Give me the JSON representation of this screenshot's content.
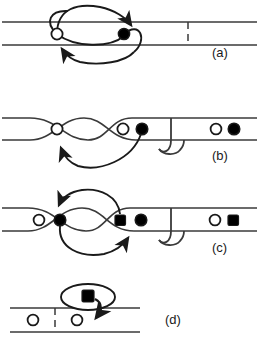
{
  "figure": {
    "type": "diagram",
    "background_color": "#ffffff",
    "stroke_color": "#1a1a1a",
    "fill_open": "#ffffff",
    "fill_solid": "#000000",
    "panels": [
      {
        "id": "a",
        "label": "(a)",
        "label_x": 212,
        "label_y": 57,
        "track": {
          "top_y": 22,
          "bottom_y": 45,
          "x_start": 2,
          "x_end": 257
        },
        "separator": {
          "x": 188,
          "style": "dashed"
        },
        "tokens": [
          {
            "shape": "circle",
            "fill": "open",
            "cx": 57,
            "cy": 34
          },
          {
            "shape": "circle",
            "fill": "solid",
            "cx": 124,
            "cy": 34
          }
        ],
        "arrows": [
          {
            "from": "open-circle",
            "to": "solid-circle",
            "direction": "right",
            "arrowhead_at": "upper-right"
          },
          {
            "from": "solid-circle",
            "to": "open-circle",
            "direction": "left",
            "arrowhead_at": "lower-left"
          }
        ]
      },
      {
        "id": "b",
        "label": "(b)",
        "label_x": 212,
        "label_y": 160,
        "track": {
          "top_y": 118,
          "bottom_y": 140,
          "x_start": 2,
          "x_end": 257
        },
        "gap": {
          "x": 168,
          "style": "j-hook"
        },
        "tokens": [
          {
            "shape": "circle",
            "fill": "open",
            "cx": 57,
            "cy": 129
          },
          {
            "shape": "circle",
            "fill": "open",
            "cx": 123,
            "cy": 129
          },
          {
            "shape": "circle",
            "fill": "solid",
            "cx": 141,
            "cy": 129
          },
          {
            "shape": "circle",
            "fill": "open",
            "cx": 216,
            "cy": 129
          },
          {
            "shape": "circle",
            "fill": "solid",
            "cx": 233,
            "cy": 129
          }
        ],
        "arrows": [
          {
            "from": "solid-circle",
            "to": "open-circle",
            "direction": "left",
            "arrowhead_at": "lower-left"
          }
        ]
      },
      {
        "id": "c",
        "label": "(c)",
        "label_x": 212,
        "label_y": 252,
        "track": {
          "top_y": 208,
          "bottom_y": 231,
          "x_start": 2,
          "x_end": 257
        },
        "gap": {
          "x": 168,
          "style": "j-hook"
        },
        "tokens": [
          {
            "shape": "circle",
            "fill": "open",
            "cx": 39,
            "cy": 220
          },
          {
            "shape": "circle",
            "fill": "solid",
            "cx": 60,
            "cy": 220
          },
          {
            "shape": "square",
            "fill": "solid",
            "cx": 120,
            "cy": 220
          },
          {
            "shape": "circle",
            "fill": "solid",
            "cx": 140,
            "cy": 220
          },
          {
            "shape": "circle",
            "fill": "open",
            "cx": 215,
            "cy": 220
          },
          {
            "shape": "square",
            "fill": "solid",
            "cx": 233,
            "cy": 220
          }
        ],
        "arrows": [
          {
            "from": "right-group",
            "to": "solid-circle-left",
            "direction": "left",
            "arrowhead_at": "upper-left"
          },
          {
            "from": "solid-circle-left",
            "to": "square",
            "direction": "right",
            "arrowhead_at": "lower-right"
          }
        ]
      },
      {
        "id": "d",
        "label": "(d)",
        "label_x": 165,
        "label_y": 324,
        "track": {
          "top_y": 308,
          "bottom_y": 332,
          "x_start": 10,
          "x_end": 140
        },
        "separator": {
          "x": 55,
          "style": "dashed"
        },
        "bubble": {
          "cx": 88,
          "cy": 297,
          "rx": 27,
          "ry": 13
        },
        "tokens": [
          {
            "shape": "circle",
            "fill": "open",
            "cx": 33,
            "cy": 320
          },
          {
            "shape": "circle",
            "fill": "open",
            "cx": 76,
            "cy": 320
          },
          {
            "shape": "square",
            "fill": "solid",
            "cx": 88,
            "cy": 297,
            "location": "bubble"
          }
        ],
        "arrows": [
          {
            "from": "bubble-square",
            "to": "track",
            "direction": "down",
            "arrowhead_at": "bottom"
          }
        ]
      }
    ]
  }
}
